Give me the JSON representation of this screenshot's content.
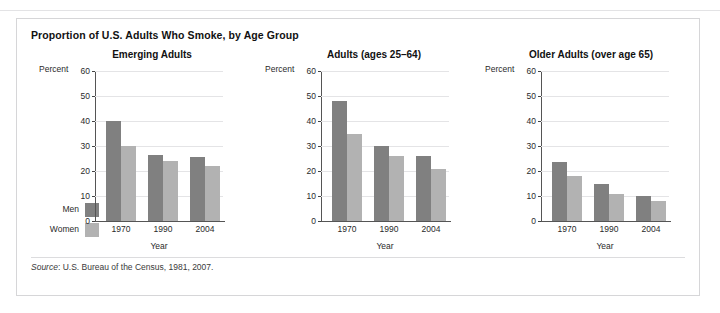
{
  "figure": {
    "title": "Proportion of U.S. Adults Who Smoke, by Age Group",
    "source_prefix": "Source",
    "source_text": ": U.S. Bureau of the Census, 1981, 2007."
  },
  "legend": {
    "items": [
      {
        "label": "Men",
        "color": "#808080"
      },
      {
        "label": "Women",
        "color": "#b2b2b2"
      }
    ]
  },
  "axis": {
    "unit_label": "Percent",
    "xlabel": "Year",
    "yticks": [
      "60",
      "50",
      "40",
      "30",
      "20",
      "10",
      "0"
    ]
  },
  "chart_data": [
    {
      "type": "bar",
      "title": "Emerging Adults",
      "categories": [
        "1970",
        "1990",
        "2004"
      ],
      "series": [
        {
          "name": "Men",
          "values": [
            40,
            26.5,
            25.5
          ],
          "color": "#808080"
        },
        {
          "name": "Women",
          "values": [
            30,
            24,
            22
          ],
          "color": "#b2b2b2"
        }
      ],
      "xlabel": "Year",
      "ylabel": "Percent",
      "ylim": [
        0,
        60
      ],
      "ytick_step": 10,
      "grid": true,
      "legend_position": "left-outside"
    },
    {
      "type": "bar",
      "title": "Adults (ages 25–64)",
      "categories": [
        "1970",
        "1990",
        "2004"
      ],
      "series": [
        {
          "name": "Men",
          "values": [
            48,
            30,
            26
          ],
          "color": "#808080"
        },
        {
          "name": "Women",
          "values": [
            35,
            26,
            21
          ],
          "color": "#b2b2b2"
        }
      ],
      "xlabel": "Year",
      "ylabel": "Percent",
      "ylim": [
        0,
        60
      ],
      "ytick_step": 10,
      "grid": true,
      "legend_position": "left-outside"
    },
    {
      "type": "bar",
      "title": "Older Adults (over age 65)",
      "categories": [
        "1970",
        "1990",
        "2004"
      ],
      "series": [
        {
          "name": "Men",
          "values": [
            23.5,
            15,
            10
          ],
          "color": "#808080"
        },
        {
          "name": "Women",
          "values": [
            18,
            11,
            8
          ],
          "color": "#b2b2b2"
        }
      ],
      "xlabel": "Year",
      "ylabel": "Percent",
      "ylim": [
        0,
        60
      ],
      "ytick_step": 10,
      "grid": true,
      "legend_position": "left-outside"
    }
  ]
}
